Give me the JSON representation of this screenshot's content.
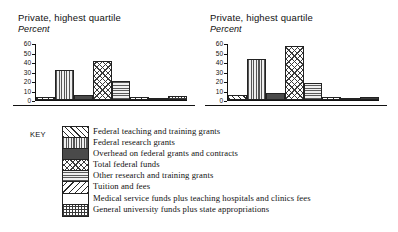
{
  "figure": {
    "panels": [
      {
        "id": "left",
        "title": "Private, highest quartile",
        "subtitle": "Percent"
      },
      {
        "id": "right",
        "title": "Private, highest quartile",
        "subtitle": "Percent"
      }
    ]
  },
  "axis": {
    "ticks": [
      "60",
      "50",
      "40",
      "30",
      "20",
      "10",
      "0"
    ],
    "ymin": 0,
    "ymax": 60
  },
  "legend": {
    "key_label": "KEY",
    "items": [
      {
        "label": "Federal teaching and training grants",
        "pattern": "forward-diagonal-hatch"
      },
      {
        "label": "Federal research grants",
        "pattern": "vertical-line-hatch"
      },
      {
        "label": "Overhead on federal grants and contracts",
        "pattern": "solid-dark-fill"
      },
      {
        "label": "Total federal funds",
        "pattern": "diagonal-cross-hatch"
      },
      {
        "label": "Other research and training grants",
        "pattern": "horizontal-line-hatch"
      },
      {
        "label": "Tuition and fees",
        "pattern": "back-diagonal-hatch"
      },
      {
        "label": "Medical service funds plus teaching hospitals and clinics fees",
        "pattern": "blank-white-fill"
      },
      {
        "label": "General university funds plus state appropriations",
        "pattern": "square-grid-hatch"
      }
    ]
  },
  "chart_data": [
    {
      "type": "bar",
      "title": "Private, highest quartile",
      "subtitle": "Percent",
      "xlabel": "",
      "ylabel": "Percent",
      "ylim": [
        0,
        60
      ],
      "yticks": [
        0,
        10,
        20,
        30,
        40,
        50,
        60
      ],
      "grid": false,
      "legend_position": "below-figure-shared",
      "categories": [
        "Federal teaching and training grants",
        "Federal research grants",
        "Overhead on federal grants and contracts",
        "Total federal funds",
        "Other research and training grants",
        "Tuition and fees",
        "Medical service funds plus teaching hospitals and clinics fees",
        "General university funds plus state appropriations"
      ],
      "values": [
        3,
        32,
        5,
        42,
        20,
        3,
        1,
        4
      ]
    },
    {
      "type": "bar",
      "title": "Private, highest quartile",
      "subtitle": "Percent",
      "xlabel": "",
      "ylabel": "Percent",
      "ylim": [
        0,
        60
      ],
      "yticks": [
        0,
        10,
        20,
        30,
        40,
        50,
        60
      ],
      "grid": false,
      "legend_position": "below-figure-shared",
      "categories": [
        "Federal teaching and training grants",
        "Federal research grants",
        "Overhead on federal grants and contracts",
        "Total federal funds",
        "Other research and training grants",
        "Tuition and fees",
        "Medical service funds plus teaching hospitals and clinics fees",
        "General university funds plus state appropriations"
      ],
      "values": [
        5,
        44,
        7,
        58,
        18,
        3,
        1,
        3
      ]
    }
  ]
}
